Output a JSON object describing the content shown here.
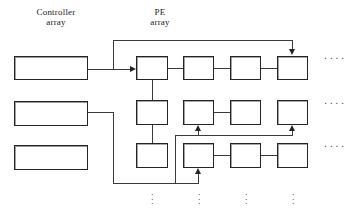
{
  "diagram": {
    "type": "block-diagram",
    "canvas": {
      "width": 359,
      "height": 216
    },
    "ink_color": "#242424",
    "line_color": "#3a3a3a",
    "background": "#ffffff",
    "labels": {
      "controller_array": "Controller\narray",
      "pe_array": "PE\narray"
    },
    "controller_array": {
      "label": "Controller array",
      "count": 3,
      "boxes": [
        {
          "name": "controller-box-1",
          "text": "",
          "x": 14,
          "y": 56,
          "w": 74,
          "h": 24
        },
        {
          "name": "controller-box-2",
          "text": "",
          "x": 14,
          "y": 101,
          "w": 74,
          "h": 25
        },
        {
          "name": "controller-box-3",
          "text": "",
          "x": 14,
          "y": 145,
          "w": 74,
          "h": 25
        }
      ]
    },
    "pe_array": {
      "label": "PE array",
      "rows": 3,
      "columns": 4,
      "row_continuation": "....",
      "column_continuation": "⋮",
      "boxes": [
        {
          "name": "pe-r1c1",
          "text": "",
          "x": 136,
          "y": 56,
          "w": 32,
          "h": 24
        },
        {
          "name": "pe-r1c2",
          "text": "",
          "x": 183,
          "y": 56,
          "w": 31,
          "h": 24
        },
        {
          "name": "pe-r1c3",
          "text": "",
          "x": 230,
          "y": 56,
          "w": 31,
          "h": 24
        },
        {
          "name": "pe-r1c4",
          "text": "",
          "x": 277,
          "y": 56,
          "w": 31,
          "h": 24
        },
        {
          "name": "pe-r2c1",
          "text": "",
          "x": 136,
          "y": 100,
          "w": 32,
          "h": 25
        },
        {
          "name": "pe-r2c2",
          "text": "",
          "x": 183,
          "y": 100,
          "w": 31,
          "h": 25
        },
        {
          "name": "pe-r2c3",
          "text": "",
          "x": 230,
          "y": 100,
          "w": 31,
          "h": 25
        },
        {
          "name": "pe-r2c4",
          "text": "",
          "x": 277,
          "y": 100,
          "w": 31,
          "h": 25
        },
        {
          "name": "pe-r3c1",
          "text": "",
          "x": 136,
          "y": 143,
          "w": 32,
          "h": 25
        },
        {
          "name": "pe-r3c2",
          "text": "",
          "x": 183,
          "y": 143,
          "w": 31,
          "h": 25
        },
        {
          "name": "pe-r3c3",
          "text": "",
          "x": 230,
          "y": 143,
          "w": 31,
          "h": 25
        },
        {
          "name": "pe-r3c4",
          "text": "",
          "x": 277,
          "y": 143,
          "w": 31,
          "h": 25
        }
      ]
    },
    "ellipses": {
      "row_dots": [
        "....",
        "....",
        "...."
      ],
      "column_dots": [
        "⋮",
        "⋮",
        "⋮",
        "⋮"
      ]
    }
  }
}
